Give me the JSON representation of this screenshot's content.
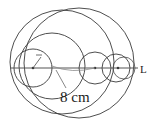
{
  "figure": {
    "background_color": "#ffffff",
    "stroke_color": "#3a3a3a",
    "labels": {
      "diameter_label": "8 cm",
      "point_label": "L",
      "radius_label": "r"
    },
    "canvas": {
      "width": 149,
      "height": 126
    },
    "outer_circle": {
      "cx": 79,
      "cy": 63,
      "r": 55
    },
    "baseline": {
      "x1": 10,
      "y1": 68,
      "x2": 140,
      "y2": 68
    },
    "circles": [
      {
        "name": "circle-small-left",
        "cx": 33,
        "cy": 68,
        "r": 19
      },
      {
        "name": "circle-medium-left",
        "cx": 52,
        "cy": 66,
        "r": 33
      },
      {
        "name": "circle-middle",
        "cx": 95,
        "cy": 68,
        "r": 16
      },
      {
        "name": "circle-right",
        "cx": 116,
        "cy": 68,
        "r": 14
      },
      {
        "name": "circle-far-right",
        "cx": 124,
        "cy": 68,
        "r": 11
      },
      {
        "name": "circle-arc-lower",
        "cx": 62,
        "cy": 62,
        "r": 52
      }
    ],
    "centers": [
      {
        "name": "center-dot-small-left",
        "cx": 33,
        "cy": 68
      },
      {
        "name": "center-dot-middle",
        "cx": 95,
        "cy": 68
      },
      {
        "name": "center-dot-right",
        "cx": 118,
        "cy": 68
      }
    ],
    "dimension": {
      "name": "radius-dimension-8cm",
      "from_x": 52,
      "from_y": 66,
      "to_x": 95,
      "to_y": 68,
      "leader_x": 65,
      "leader_y": 88,
      "text_x": 62,
      "text_y": 101
    },
    "point_marker": {
      "x": 141,
      "y": 72
    },
    "radius_tick": {
      "x1": 33,
      "y1": 68,
      "x2": 41,
      "y2": 56,
      "text_x": 36,
      "text_y": 56
    }
  }
}
